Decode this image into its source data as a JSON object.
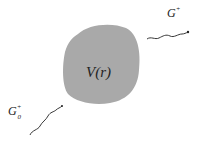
{
  "diagram": {
    "potential_label": "V(r)",
    "incoming": {
      "symbol": "G",
      "sub": "0",
      "sup": "+"
    },
    "outgoing": {
      "symbol": "G",
      "sup": "+"
    },
    "colors": {
      "blob": "#a9a9a9",
      "line": "#222222",
      "text": "#222222"
    }
  }
}
